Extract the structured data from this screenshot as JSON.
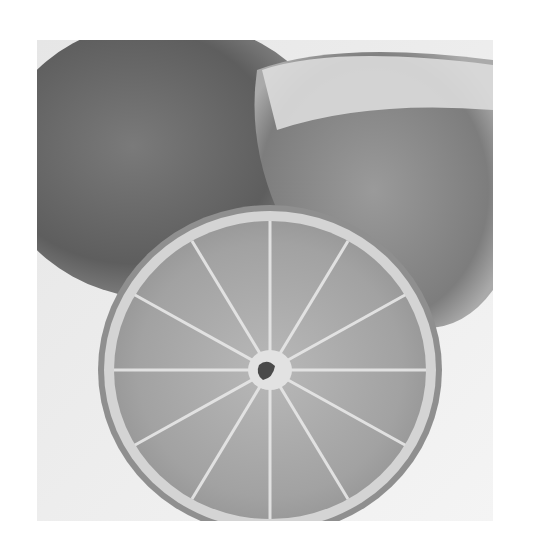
{
  "image": {
    "subject": "grayscale photo of citrus fruit: a halved lime/lemon cross-section in front of two whole/cut fruits",
    "colors": {
      "background": "#ffffff",
      "photo_bg": "#f0f0f0",
      "back_fruit_left": "#6a6a6a",
      "back_fruit_right": "#a8a8a8",
      "slice_rind": "#c8c8c8",
      "slice_flesh": "#a9a9a9",
      "segment_lines": "#e6e6e6",
      "core_dark": "#4a4a4a"
    },
    "segments": 12
  }
}
